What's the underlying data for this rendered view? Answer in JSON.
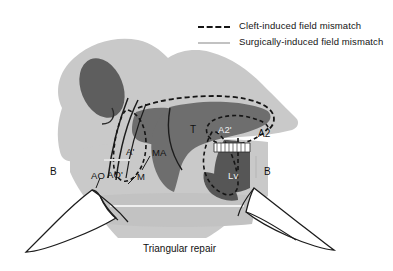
{
  "figure": {
    "caption": "Triangular repair",
    "background_color": "#ffffff",
    "palette": {
      "skin_light": "#c9c9c9",
      "skin_mid": "#b5b5b5",
      "tissue_dark": "#6e6e6e",
      "tissue_darker": "#565656",
      "nostril": "#5e5e5e",
      "lobe_white": "#ffffff",
      "outline": "#1c1c1c",
      "surgical_line": "#c2c2c2"
    }
  },
  "legend": {
    "items": [
      {
        "label": "Cleft-induced field mismatch",
        "style": "dashed",
        "color": "#151515"
      },
      {
        "label": "Surgically-induced field mismatch",
        "style": "solid",
        "color": "#c2c2c2"
      }
    ]
  },
  "annotations": [
    {
      "id": "b-left",
      "text": "B",
      "x": 50,
      "y": 167,
      "tone": "dark"
    },
    {
      "id": "ao",
      "text": "AO",
      "x": 91,
      "y": 171,
      "tone": "dark"
    },
    {
      "id": "ao-prime",
      "text": "AO'",
      "x": 107,
      "y": 170,
      "tone": "dark"
    },
    {
      "id": "a-prime",
      "text": "A'",
      "x": 126,
      "y": 147,
      "tone": "dark"
    },
    {
      "id": "ma",
      "text": "MA",
      "x": 152,
      "y": 148,
      "tone": "dark"
    },
    {
      "id": "m",
      "text": "M",
      "x": 137,
      "y": 172,
      "tone": "dark"
    },
    {
      "id": "t",
      "text": "T",
      "x": 190,
      "y": 125,
      "tone": "dark"
    },
    {
      "id": "a2-prime",
      "text": "A2'",
      "x": 218,
      "y": 125,
      "tone": "light"
    },
    {
      "id": "a2",
      "text": "A2",
      "x": 258,
      "y": 129,
      "tone": "dark"
    },
    {
      "id": "lv",
      "text": "Lv",
      "x": 228,
      "y": 171,
      "tone": "light"
    },
    {
      "id": "b-right",
      "text": "B",
      "x": 264,
      "y": 167,
      "tone": "dark"
    }
  ]
}
